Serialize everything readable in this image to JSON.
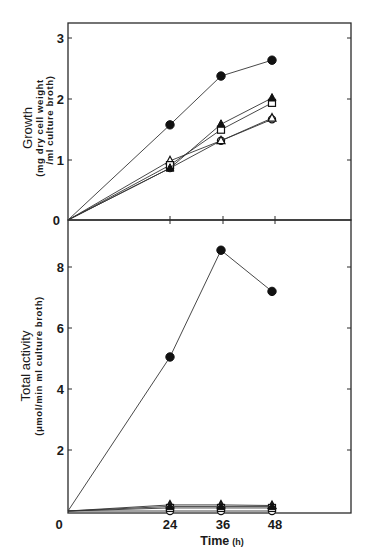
{
  "chart_data": [
    {
      "type": "line",
      "panel": "top",
      "title": "",
      "ylabel": "Growth",
      "ylabel_sub": [
        "(mg dry cell weight",
        "/ml culture broth)"
      ],
      "xlabel": "Time",
      "xlabel_unit": "(h)",
      "x": [
        0,
        24,
        36,
        48
      ],
      "xlim": [
        0,
        72
      ],
      "ylim": [
        0,
        3.25
      ],
      "yticks": [
        0,
        1,
        2,
        3
      ],
      "xticks": [
        24,
        36,
        48
      ],
      "grid": false,
      "legend": "none",
      "series": [
        {
          "name": "filled circle",
          "marker": "filled-circle",
          "values": [
            0,
            1.56,
            2.36,
            2.62
          ]
        },
        {
          "name": "filled triangle",
          "marker": "filled-triangle",
          "values": [
            0,
            0.85,
            1.57,
            2.0
          ]
        },
        {
          "name": "open square",
          "marker": "open-square",
          "values": [
            0,
            0.9,
            1.48,
            1.92
          ]
        },
        {
          "name": "open triangle",
          "marker": "open-triangle",
          "values": [
            0,
            0.97,
            1.3,
            1.67
          ]
        },
        {
          "name": "open circle",
          "marker": "open-circle",
          "values": [
            0,
            0.85,
            1.3,
            1.65
          ]
        }
      ]
    },
    {
      "type": "line",
      "panel": "bottom",
      "title": "",
      "ylabel": "Total activity",
      "ylabel_sub": [
        "(μmol/min ml culture broth)"
      ],
      "xlabel": "Time",
      "xlabel_unit": "(h)",
      "x": [
        0,
        24,
        36,
        48
      ],
      "xlim": [
        0,
        72
      ],
      "ylim": [
        0,
        9.6
      ],
      "yticks": [
        0,
        2,
        4,
        6,
        8
      ],
      "xticks": [
        0,
        24,
        36,
        48
      ],
      "grid": false,
      "legend": "none",
      "series": [
        {
          "name": "filled circle",
          "marker": "filled-circle",
          "values": [
            0,
            5.05,
            8.55,
            7.2
          ]
        },
        {
          "name": "filled triangle",
          "marker": "filled-triangle",
          "values": [
            0,
            0.15,
            0.15,
            0.15
          ]
        },
        {
          "name": "open square",
          "marker": "open-square",
          "values": [
            0,
            0.1,
            0.1,
            0.1
          ]
        },
        {
          "name": "open triangle",
          "marker": "open-triangle",
          "values": [
            0,
            0.2,
            0.2,
            0.18
          ]
        },
        {
          "name": "open circle",
          "marker": "open-circle",
          "values": [
            0,
            0.0,
            0.0,
            0.0
          ]
        }
      ]
    }
  ],
  "labels": {
    "top_ylabel": "Growth",
    "top_ylabel_sub1": "(mg dry cell weight",
    "top_ylabel_sub2": "/ml culture broth)",
    "bottom_ylabel": "Total activity",
    "bottom_ylabel_sub": "(μmol/min ml culture broth)",
    "xlabel": "Time",
    "xlabel_unit": "(h)",
    "top_yticks": [
      "0",
      "1",
      "2",
      "3"
    ],
    "bottom_yticks": [
      "2",
      "4",
      "6",
      "8"
    ],
    "xticks": [
      "0",
      "24",
      "36",
      "48"
    ]
  }
}
